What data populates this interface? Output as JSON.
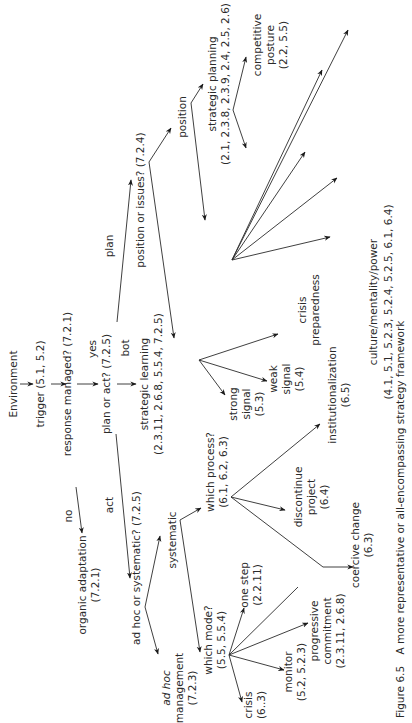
{
  "figure": {
    "orientation": "rotated 90 degrees counter-clockwise",
    "caption_label": "Figure 6.5",
    "caption_text": "A more representative or all-encompassing strategy framework"
  },
  "nodes": {
    "environment": "Environment",
    "trigger": "trigger (5.1, 5.2)",
    "response_managed": "response managed? (7.2.1)",
    "yes": "yes",
    "no": "no",
    "organic_adaptation_1": "organic adaptation",
    "organic_adaptation_2": "(7.2.1)",
    "plan_or_act": "plan or act? (7.2.5)",
    "plan": "plan",
    "act": "act",
    "bot": "bot",
    "strategic_learning_1": "strategic learning",
    "strategic_learning_2": "(2.3.11, 2.6.8, 5.5.4, 7.2.5)",
    "position_or_issues": "position or issues? (7.2.4)",
    "position": "position",
    "strategic_planning_1": "strategic planning",
    "strategic_planning_2": "(2.1, 2.3.8, 2.3.9, 2.4, 2.5, 2.6)",
    "competitive_posture_1": "competitive",
    "competitive_posture_2": "posture",
    "competitive_posture_3": "(2.2, 5.5)",
    "strong_signal_1": "strong",
    "strong_signal_2": "signal",
    "strong_signal_3": "(5.3)",
    "weak_signal_1": "weak",
    "weak_signal_2": "signal",
    "weak_signal_3": "(5.4)",
    "crisis_preparedness_1": "crisis",
    "crisis_preparedness_2": "preparedness",
    "culture_1": "culture/mentality/power",
    "culture_2": "(4.1, 5.1, 5.2.3, 5.2.4, 5.2.5, 6.1, 6.4)",
    "institutionalization_1": "institutionalization",
    "institutionalization_2": "(6.5)",
    "adhoc_or_systematic_a": "ad hoc",
    "adhoc_or_systematic_b": " or systematic? (7.2.5)",
    "systematic": "systematic",
    "adhoc_mgmt_1": "ad hoc",
    "adhoc_mgmt_2": "management",
    "adhoc_mgmt_3": "(7.2.3)",
    "which_process_1": "which process?",
    "which_process_2": "(6.1, 6.2, 6.3)",
    "discontinue_1": "discontinue",
    "discontinue_2": "project",
    "discontinue_3": "(6.4)",
    "coercive_1": "coercive change",
    "coercive_2": "(6.3)",
    "which_mode_1": "which mode?",
    "which_mode_2": "(5.5, 5.5.4)",
    "one_step_1": "one step",
    "one_step_2": "(2.2.11)",
    "crisis_1": "crisis",
    "crisis_2": "(6..3)",
    "monitor_1": "monitor",
    "monitor_2": "(5.2, 5.2.3)",
    "progressive_1": "progressive",
    "progressive_2": "commitment",
    "progressive_3": "(2.3.11, 2.6.8)"
  }
}
